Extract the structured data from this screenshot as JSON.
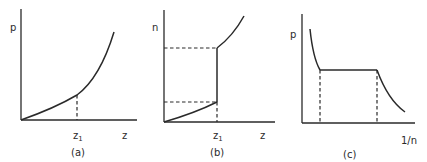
{
  "figure": {
    "panels": [
      {
        "id": "a",
        "caption": "(a)",
        "y_label": "p",
        "x_label": "z",
        "x_tick_label": "z",
        "x_tick_subscript": "1",
        "description": "p increases smoothly and convexly with z; dashed vertical marks z1"
      },
      {
        "id": "b",
        "caption": "(b)",
        "y_label": "n",
        "x_label": "z",
        "x_tick_label": "z",
        "x_tick_subscript": "1",
        "description": "n increases with z, with a discontinuous jump at z1; dashed lines mark the lower and upper values of n at the jump"
      },
      {
        "id": "c",
        "caption": "(c)",
        "y_label": "p",
        "x_label": "1/n",
        "description": "p versus 1/n: decreasing curve, flat plateau between two dashed verticals, then decreasing curve"
      }
    ],
    "colors": {
      "line": "#2a2a2a",
      "background": "#ffffff"
    }
  }
}
